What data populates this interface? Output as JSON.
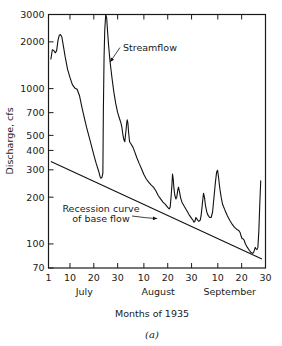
{
  "chart_data": {
    "type": "line",
    "title": "",
    "caption": "(a)",
    "xlabel": "Months of 1935",
    "ylabel": "Discharge, cfs",
    "yscale": "log",
    "ylim": [
      70,
      3000
    ],
    "ytick_labels": [
      "3000",
      "2000",
      "1000",
      "700",
      "500",
      "400",
      "300",
      "200",
      "100",
      "70"
    ],
    "ytick_values": [
      3000,
      2000,
      1000,
      700,
      500,
      400,
      300,
      200,
      100,
      70
    ],
    "xlim": [
      1,
      92
    ],
    "xtick_labels": [
      "1",
      "10",
      "20",
      "30",
      "10",
      "20",
      "30",
      "10",
      "20",
      "30"
    ],
    "xtick_days": [
      1,
      10,
      20,
      30,
      41,
      51,
      61,
      72,
      82,
      92
    ],
    "month_labels": [
      "July",
      "August",
      "September"
    ],
    "month_centers": [
      16,
      47,
      77
    ],
    "grid": false,
    "legend": "none",
    "annotations": [
      {
        "name": "streamflow",
        "text": "Streamflow",
        "text_line1": "Streamflow",
        "text_line2": "",
        "point_day": 26,
        "point_value": 1550
      },
      {
        "name": "recession-curve",
        "text": "Recession curve of base flow",
        "text_line1": "Recession curve",
        "text_line2": "of base flow",
        "point_day": 47,
        "point_value": 150
      }
    ],
    "series": [
      {
        "name": "Streamflow",
        "style": "solid",
        "points": [
          [
            2.0,
            1550
          ],
          [
            2.6,
            1780
          ],
          [
            3.2,
            1760
          ],
          [
            3.8,
            1700
          ],
          [
            4.4,
            1750
          ],
          [
            5.0,
            2050
          ],
          [
            5.5,
            2200
          ],
          [
            6.0,
            2230
          ],
          [
            6.6,
            2150
          ],
          [
            7.2,
            1900
          ],
          [
            8.0,
            1600
          ],
          [
            9.0,
            1330
          ],
          [
            10.0,
            1180
          ],
          [
            11.0,
            1060
          ],
          [
            12.0,
            1010
          ],
          [
            13.0,
            990
          ],
          [
            14.0,
            900
          ],
          [
            15.0,
            760
          ],
          [
            16.0,
            650
          ],
          [
            17.0,
            560
          ],
          [
            18.0,
            490
          ],
          [
            19.0,
            430
          ],
          [
            20.0,
            375
          ],
          [
            21.0,
            330
          ],
          [
            22.0,
            295
          ],
          [
            22.6,
            272
          ],
          [
            23.0,
            265
          ],
          [
            23.4,
            268
          ],
          [
            23.8,
            285
          ],
          [
            24.0,
            700
          ],
          [
            24.3,
            1600
          ],
          [
            24.6,
            2400
          ],
          [
            25.0,
            3000
          ],
          [
            25.4,
            2850
          ],
          [
            25.8,
            2300
          ],
          [
            26.2,
            1900
          ],
          [
            26.8,
            1500
          ],
          [
            27.6,
            1180
          ],
          [
            28.4,
            950
          ],
          [
            29.2,
            800
          ],
          [
            30.0,
            700
          ],
          [
            30.8,
            640
          ],
          [
            31.4,
            600
          ],
          [
            31.8,
            560
          ],
          [
            32.2,
            505
          ],
          [
            32.6,
            470
          ],
          [
            33.0,
            455
          ],
          [
            33.4,
            520
          ],
          [
            33.8,
            600
          ],
          [
            34.0,
            630
          ],
          [
            34.3,
            600
          ],
          [
            34.6,
            520
          ],
          [
            35.0,
            455
          ],
          [
            35.6,
            440
          ],
          [
            36.4,
            420
          ],
          [
            37.2,
            390
          ],
          [
            38.0,
            360
          ],
          [
            39.0,
            330
          ],
          [
            40.0,
            305
          ],
          [
            41.0,
            280
          ],
          [
            42.0,
            262
          ],
          [
            43.0,
            250
          ],
          [
            44.0,
            240
          ],
          [
            45.0,
            232
          ],
          [
            46.0,
            220
          ],
          [
            47.0,
            205
          ],
          [
            48.0,
            195
          ],
          [
            49.0,
            186
          ],
          [
            50.0,
            180
          ],
          [
            51.0,
            172
          ],
          [
            51.6,
            168
          ],
          [
            52.0,
            172
          ],
          [
            52.4,
            200
          ],
          [
            52.8,
            245
          ],
          [
            53.0,
            282
          ],
          [
            53.3,
            262
          ],
          [
            53.6,
            228
          ],
          [
            54.0,
            205
          ],
          [
            54.4,
            195
          ],
          [
            54.8,
            200
          ],
          [
            55.2,
            222
          ],
          [
            55.5,
            232
          ],
          [
            55.9,
            218
          ],
          [
            56.4,
            198
          ],
          [
            57.0,
            185
          ],
          [
            57.8,
            176
          ],
          [
            58.6,
            168
          ],
          [
            59.4,
            160
          ],
          [
            60.2,
            152
          ],
          [
            61.0,
            146
          ],
          [
            61.6,
            142
          ],
          [
            62.0,
            138
          ],
          [
            62.4,
            140
          ],
          [
            62.8,
            148
          ],
          [
            63.2,
            145
          ],
          [
            63.6,
            142
          ],
          [
            64.0,
            140
          ],
          [
            64.6,
            142
          ],
          [
            65.0,
            152
          ],
          [
            65.5,
            180
          ],
          [
            66.0,
            212
          ],
          [
            66.4,
            200
          ],
          [
            66.8,
            178
          ],
          [
            67.4,
            160
          ],
          [
            68.0,
            152
          ],
          [
            68.6,
            148
          ],
          [
            69.2,
            148
          ],
          [
            69.8,
            160
          ],
          [
            70.4,
            200
          ],
          [
            71.0,
            250
          ],
          [
            71.5,
            290
          ],
          [
            71.9,
            298
          ],
          [
            72.3,
            270
          ],
          [
            72.8,
            230
          ],
          [
            73.4,
            200
          ],
          [
            74.0,
            180
          ],
          [
            75.0,
            165
          ],
          [
            76.0,
            152
          ],
          [
            77.0,
            142
          ],
          [
            78.0,
            134
          ],
          [
            79.0,
            128
          ],
          [
            80.0,
            124
          ],
          [
            80.8,
            122
          ],
          [
            81.4,
            118
          ],
          [
            81.8,
            112
          ],
          [
            82.2,
            108
          ],
          [
            82.6,
            108
          ],
          [
            83.0,
            106
          ],
          [
            83.6,
            100
          ],
          [
            84.4,
            95
          ],
          [
            85.2,
            91
          ],
          [
            86.0,
            88
          ],
          [
            86.6,
            87
          ],
          [
            87.0,
            88
          ],
          [
            87.4,
            92
          ],
          [
            87.7,
            95
          ],
          [
            88.0,
            93
          ],
          [
            88.4,
            92
          ],
          [
            88.8,
            95
          ],
          [
            89.2,
            120
          ],
          [
            89.6,
            180
          ],
          [
            90.0,
            255
          ]
        ]
      },
      {
        "name": "Recession curve of base flow",
        "style": "solid",
        "points": [
          [
            2.0,
            340
          ],
          [
            90.5,
            80
          ]
        ]
      }
    ]
  }
}
